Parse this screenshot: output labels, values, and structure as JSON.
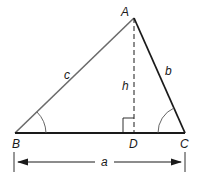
{
  "diagram": {
    "type": "triangle-with-altitude",
    "vertices": {
      "A": "A",
      "B": "B",
      "C": "C",
      "D": "D"
    },
    "sides": {
      "a": "a",
      "b": "b",
      "c": "c",
      "h": "h"
    },
    "colors": {
      "side_c": "#6b6b6b",
      "side_b": "#1a1a1a",
      "base": "#1a1a1a",
      "altitude": "#1a1a1a"
    }
  }
}
